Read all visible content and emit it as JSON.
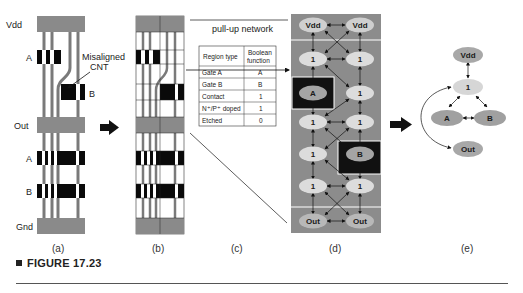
{
  "figure": {
    "caption_label": "FIGURE 17.23",
    "panels": {
      "a": {
        "label": "(a)",
        "rail_labels": {
          "vdd": "Vdd",
          "out": "Out",
          "gnd": "Gnd"
        },
        "gate_labels": {
          "a_top": "A",
          "b_top": "B",
          "a_bottom": "A",
          "b_bottom": "B"
        },
        "annotation_line1": "Misaligned",
        "annotation_line2": "CNT"
      },
      "b": {
        "label": "(b)"
      },
      "c": {
        "label": "(c)",
        "pullup_label": "pull-up network",
        "table": {
          "headers": [
            "Region type",
            "Boolean function"
          ],
          "header_col2_line1": "Boolean",
          "header_col2_line2": "function",
          "rows": [
            [
              "Gate A",
              "A"
            ],
            [
              "Gate B",
              "B"
            ],
            [
              "Contact",
              "1"
            ],
            [
              "N⁺/P⁺ doped",
              "1"
            ],
            [
              "Etched",
              "0"
            ]
          ]
        }
      },
      "d": {
        "label": "(d)",
        "nodes": {
          "r0c0": "Vdd",
          "r0c1": "Vdd",
          "r1c0": "1",
          "r1c1": "1",
          "r2c0": "A",
          "r2c1": "1",
          "r3c0": "1",
          "r3c1": "1",
          "r4c0": "1",
          "r4c1": "B",
          "r5c0": "1",
          "r5c1": "1",
          "r6c0": "Out",
          "r6c1": "Out"
        }
      },
      "e": {
        "label": "(e)",
        "nodes": {
          "vdd": "Vdd",
          "one": "1",
          "a": "A",
          "b": "B",
          "out": "Out"
        }
      }
    },
    "colors": {
      "rail_gray": "#8a8a8a",
      "cnt_gray": "#7a7a7a",
      "gate_black": "#0a0a0a",
      "grid_bg": "#8c8c8c",
      "node_light": "#cfcfcf",
      "node_dark": "#a4a4a4",
      "gate_region": "#111111"
    }
  }
}
